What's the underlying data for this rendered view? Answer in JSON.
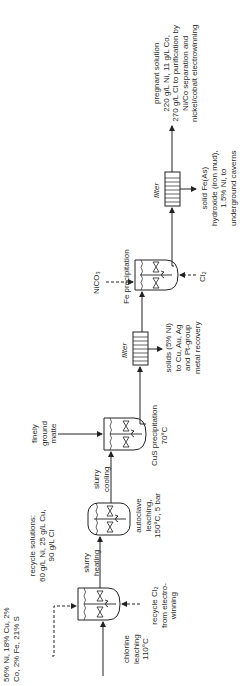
{
  "diagram": {
    "feed": {
      "lines": [
        "56% Ni, 18% Cu, 2%",
        "Co, 2% Fe, 21% S"
      ]
    },
    "recycle_solutions": {
      "lines": [
        "recycle solutions:",
        "60 g/L Ni, 25 g/L Cu,",
        "90 g/L Cl"
      ]
    },
    "recycle_cl2": {
      "lines": [
        "recycle Cl₂",
        "from electro-",
        "winning"
      ]
    },
    "units": [
      {
        "id": "chlorine-leaching",
        "lines": [
          "chlorine",
          "leaching",
          "110°C"
        ]
      },
      {
        "id": "autoclave-leaching",
        "lines": [
          "autoclave",
          "leaching,",
          "150°C, 5 bar"
        ]
      },
      {
        "id": "cus-precipitation",
        "lines": [
          "CuS precipitation",
          "70°C"
        ]
      },
      {
        "id": "filter-1",
        "lines": [
          "filter"
        ]
      },
      {
        "id": "fe-precipitation",
        "lines": [
          "Fe precipitation"
        ]
      },
      {
        "id": "filter-2",
        "lines": [
          "filter"
        ]
      }
    ],
    "streams": {
      "slurry_heating": [
        "slurry",
        "heating"
      ],
      "slurry_cooling": [
        "slurry",
        "cooling"
      ],
      "ground_matte": [
        "finely",
        "ground",
        "matte"
      ],
      "solids_cus": [
        "solids (5% Ni)",
        "to Cu, Au, Ag",
        "and Pt-group",
        "metal recovery"
      ],
      "nico3": "NiCO₃",
      "cl2": "Cl₂",
      "solid_fe": [
        "solid Fe(As)",
        "hydroxide (iron mud),",
        "1.5% Ni, to",
        "underground caverns"
      ],
      "pregnant": [
        "pregnant solution",
        "220 g/L Ni, 11 g/L Co,",
        "270 g/L Cl to purification by",
        "Ni/Co separation and",
        "nickel/cobalt electrowinning"
      ]
    },
    "colors": {
      "line": "#222222",
      "background": "#ffffff"
    },
    "orientation": "rotated 90° counter-clockwise"
  }
}
